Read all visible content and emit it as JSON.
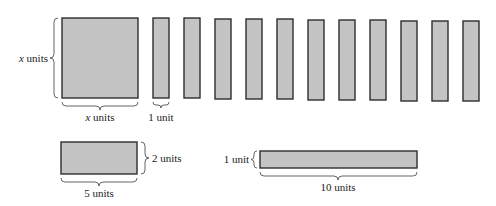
{
  "colors": {
    "tile_fill": "#c4c4c4",
    "tile_stroke": "#2e2e2e",
    "background": "#ffffff"
  },
  "tiles": {
    "x_square": {
      "side_label_var": "x",
      "side_label_unit": " units",
      "bottom_label_var": "x",
      "bottom_label_unit": " units"
    },
    "x_by_1_strips": {
      "count": 11,
      "bottom_label": "1 unit"
    },
    "rect_5_by_2": {
      "width_label": "5 units",
      "height_label": "2 units"
    },
    "rect_10_by_1": {
      "width_label": "10 units",
      "height_label": "1 unit"
    }
  }
}
